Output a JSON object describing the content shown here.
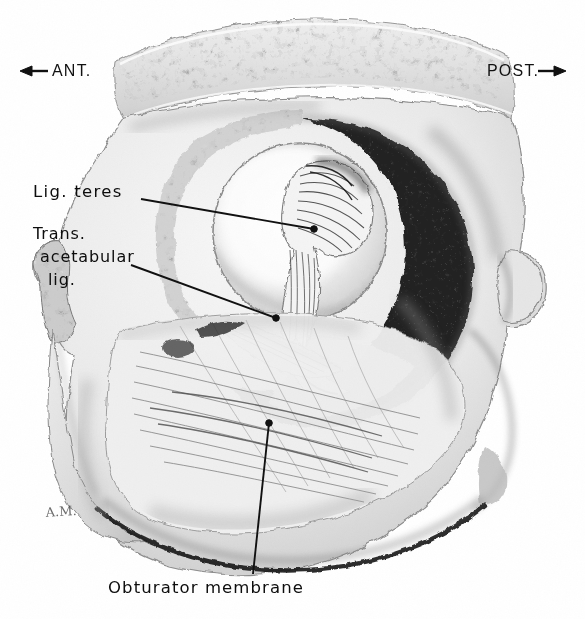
{
  "figure": {
    "kind": "anatomical-illustration",
    "rendering": "grayscale pencil / carbon dust medical illustration",
    "background_color": "#ffffff",
    "ink_color": "#0d0d0d",
    "artist_signature": "A.M."
  },
  "orientation": {
    "left_label": "ANT.",
    "left_arrow_glyph": "←",
    "right_label": "POST.",
    "right_arrow_glyph": "→"
  },
  "labels": {
    "lig_teres": "Lig. teres",
    "trans_acetabular_line1": "Trans.",
    "trans_acetabular_line2": "acetabular",
    "trans_acetabular_line3": "lig.",
    "obturator_membrane": "Obturator membrane"
  },
  "leader_lines": [
    {
      "name": "lig-teres-leader",
      "from": [
        141,
        199
      ],
      "to": [
        314,
        229
      ],
      "terminus": "dot"
    },
    {
      "name": "trans-acet-leader",
      "from": [
        131,
        265
      ],
      "to": [
        276,
        318
      ],
      "terminus": "dot"
    },
    {
      "name": "obturator-leader",
      "from": [
        253,
        574
      ],
      "to": [
        269,
        423
      ],
      "terminus": "dot"
    }
  ],
  "structures": [
    {
      "name": "iliac-crest-cut-surface",
      "note": "speckled cancellous bone along superior cut edge"
    },
    {
      "name": "acetabular-fossa",
      "note": "pale ovoid cavity, center of figure"
    },
    {
      "name": "lunate-surface",
      "note": "dark horseshoe of articular cartilage, posterior"
    },
    {
      "name": "ligamentum-teres",
      "note": "fan-shaped fibrous band within fossa"
    },
    {
      "name": "transverse-acetabular-ligament",
      "note": "band bridging the acetabular notch"
    },
    {
      "name": "obturator-membrane",
      "note": "striated sheet filling obturator foramen"
    },
    {
      "name": "ischial-tuberosity",
      "note": "posterior-inferior bony prominence"
    },
    {
      "name": "pubic-ramus-cut-edge",
      "note": "rough trabecular edge at left margin"
    }
  ]
}
